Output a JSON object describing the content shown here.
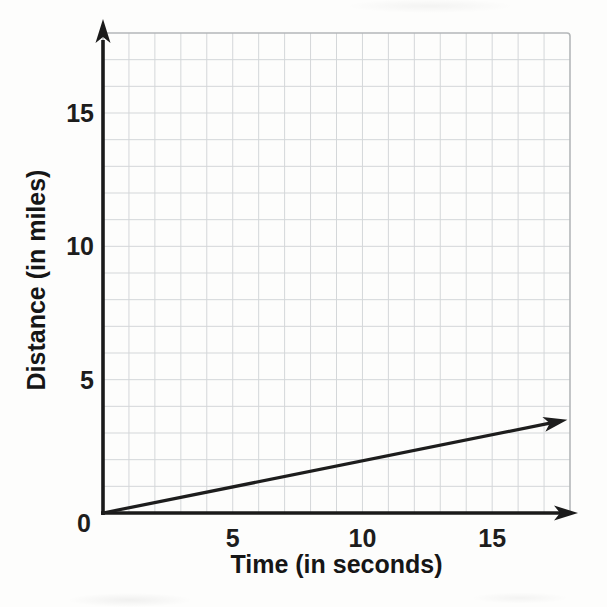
{
  "chart_data": {
    "type": "line",
    "title": "",
    "xlabel": "Time (in seconds)",
    "ylabel": "Distance (in miles)",
    "xlim": [
      0,
      18
    ],
    "ylim": [
      0,
      18
    ],
    "x_ticks": [
      5,
      10,
      15
    ],
    "x_tick_labels": [
      "5",
      "10",
      "15"
    ],
    "y_ticks": [
      5,
      10,
      15
    ],
    "y_tick_labels": [
      "15",
      "10",
      "5"
    ],
    "origin_label": "0",
    "grid": {
      "on": true,
      "step": 1,
      "color": "#d4d7d9",
      "border_color": "#b4b7b9"
    },
    "axis_color": "#1a1a1a",
    "series": [
      {
        "name": "distance-vs-time-ray",
        "color": "#1d1d1d",
        "points": [
          [
            0,
            0
          ],
          [
            17.9,
            3.5
          ]
        ],
        "slope_miles_per_second": 0.2,
        "style": "ray-with-arrowhead"
      }
    ],
    "arrows": [
      "y-axis-top",
      "x-axis-right",
      "series-end"
    ],
    "legend": null
  }
}
